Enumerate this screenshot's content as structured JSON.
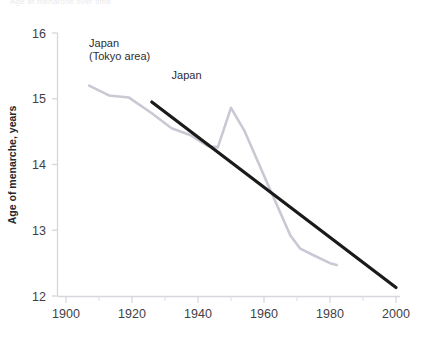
{
  "figure": {
    "cut_off_header": "Age at menarche over time",
    "background": "#ffffff"
  },
  "chart_data": {
    "type": "line",
    "title": "",
    "xlabel": "",
    "ylabel": "Age of menarche, years",
    "xlim": [
      1900,
      2000
    ],
    "ylim": [
      12,
      16
    ],
    "xticks": [
      1900,
      1920,
      1940,
      1960,
      1980,
      2000
    ],
    "xtick_labels": [
      "1900",
      "1920",
      "1940",
      "1960",
      "1980",
      "2000"
    ],
    "xminor_ticks": [
      1910,
      1930,
      1950,
      1970,
      1990
    ],
    "yticks": [
      12,
      13,
      14,
      15,
      16
    ],
    "ytick_labels": [
      "12",
      "13",
      "14",
      "15",
      "16"
    ],
    "grid": false,
    "legend_position": "inline-annotations",
    "series": [
      {
        "name": "Japan (Tokyo area)",
        "color": "#c9c9d4",
        "width": 2.6,
        "label_x": 1907,
        "label_y": 15.78,
        "points": [
          [
            1907,
            15.2
          ],
          [
            1913,
            15.05
          ],
          [
            1919,
            15.02
          ],
          [
            1926,
            14.78
          ],
          [
            1932,
            14.55
          ],
          [
            1938,
            14.44
          ],
          [
            1943,
            14.28
          ],
          [
            1946,
            14.26
          ],
          [
            1950,
            14.86
          ],
          [
            1954,
            14.52
          ],
          [
            1962,
            13.6
          ],
          [
            1968,
            12.92
          ],
          [
            1971,
            12.72
          ],
          [
            1975,
            12.62
          ],
          [
            1980,
            12.5
          ],
          [
            1982,
            12.47
          ]
        ]
      },
      {
        "name": "Japan",
        "color": "#1a1a1a",
        "width": 3.2,
        "label_x": 1932,
        "label_y": 15.3,
        "points": [
          [
            1926,
            14.95
          ],
          [
            2000,
            12.13
          ]
        ]
      }
    ]
  }
}
